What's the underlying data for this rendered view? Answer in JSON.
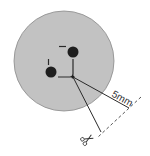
{
  "diagram": {
    "type": "cutting-guide",
    "measurement_label": "5mm",
    "colors": {
      "background": "#ffffff",
      "disc_fill": "#c2c2c2",
      "disc_stroke": "#8a8a8a",
      "dot": "#1e1e1e",
      "line": "#2a2a2a",
      "dashed": "#555555"
    },
    "icons": {
      "cut": "scissors-icon"
    }
  }
}
